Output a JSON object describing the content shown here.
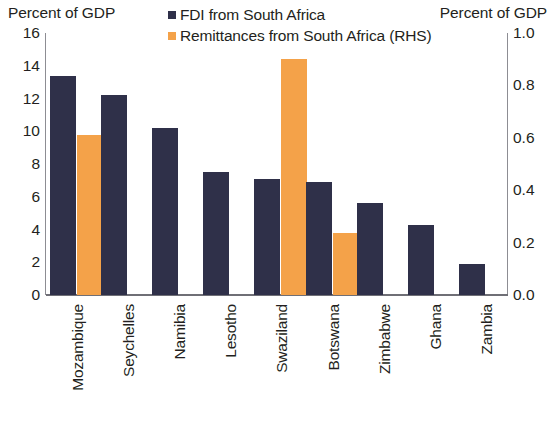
{
  "axis_titles": {
    "left": "Percent of GDP",
    "right": "Percent of GDP"
  },
  "legend": {
    "items": [
      {
        "label": "FDI from South Africa",
        "color": "#2f3049",
        "icon": "square-swatch-navy"
      },
      {
        "label": "Remittances from South Africa (RHS)",
        "color": "#f4a249",
        "icon": "square-swatch-orange"
      }
    ]
  },
  "chart_data": {
    "type": "bar",
    "title": "",
    "subtitle": "",
    "xlabel": "",
    "ylabel": "Percent of GDP",
    "y2label": "Percent of GDP",
    "grid": false,
    "legend_position": "top-center",
    "categories": [
      "Mozambique",
      "Seychelles",
      "Namibia",
      "Lesotho",
      "Swaziland",
      "Botswana",
      "Zimbabwe",
      "Ghana",
      "Zambia"
    ],
    "series": [
      {
        "name": "FDI from South Africa",
        "color": "#2f3049",
        "axis": "left",
        "values": [
          13.4,
          12.2,
          10.2,
          7.5,
          7.1,
          6.9,
          5.6,
          4.3,
          1.9
        ]
      },
      {
        "name": "Remittances from South Africa (RHS)",
        "color": "#f4a249",
        "axis": "right",
        "values": [
          0.61,
          null,
          null,
          null,
          0.9,
          0.235,
          null,
          null,
          null
        ]
      }
    ],
    "ylim": [
      0,
      16
    ],
    "yticks": [
      0,
      2,
      4,
      6,
      8,
      10,
      12,
      14,
      16
    ],
    "ytick_labels": [
      "0",
      "2",
      "4",
      "6",
      "8",
      "10",
      "12",
      "14",
      "16"
    ],
    "y2lim": [
      0.0,
      1.0
    ],
    "y2ticks": [
      0.0,
      0.2,
      0.4,
      0.6,
      0.8,
      1.0
    ],
    "y2tick_labels": [
      "0.0",
      "0.2",
      "0.4",
      "0.6",
      "0.8",
      "1.0"
    ]
  }
}
